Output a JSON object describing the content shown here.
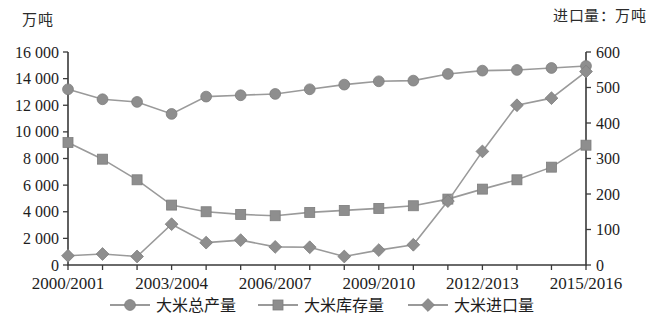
{
  "titles": {
    "left_axis_unit": "万吨",
    "right_axis_unit": "进口量：万吨"
  },
  "chart_data": {
    "type": "line",
    "title": "",
    "subtitle": "",
    "xlabel": "",
    "ylabel": "万吨",
    "y2label": "进口量：万吨",
    "grid": false,
    "legend_position": "bottom",
    "categories": [
      "2000/2001",
      "2001/2002",
      "2002/2003",
      "2003/2004",
      "2004/2005",
      "2005/2006",
      "2006/2007",
      "2007/2008",
      "2008/2009",
      "2009/2010",
      "2010/2011",
      "2011/2012",
      "2012/2013",
      "2013/2014",
      "2014/2015",
      "2015/2016"
    ],
    "x_tick_labels": [
      "2000/2001",
      "2003/2004",
      "2006/2007",
      "2009/2010",
      "2012/2013",
      "2015/2016"
    ],
    "x_tick_indices": [
      0,
      3,
      6,
      9,
      12,
      15
    ],
    "ylim": [
      0,
      16000
    ],
    "y_ticks": [
      0,
      2000,
      4000,
      6000,
      8000,
      10000,
      12000,
      14000,
      16000
    ],
    "y_tick_labels": [
      "0",
      "2 000",
      "4 000",
      "6 000",
      "8 000",
      "10 000",
      "12 000",
      "14 000",
      "16 000"
    ],
    "y2lim": [
      0,
      600
    ],
    "y2_ticks": [
      0,
      100,
      200,
      300,
      400,
      500,
      600
    ],
    "y2_tick_labels": [
      "0",
      "100",
      "200",
      "300",
      "400",
      "500",
      "600"
    ],
    "series": [
      {
        "name": "大米总产量",
        "axis": "left",
        "marker": "circle",
        "color": "#8e8e8e",
        "values": [
          13200,
          12450,
          12250,
          11350,
          12650,
          12750,
          12850,
          13200,
          13550,
          13800,
          13850,
          14350,
          14600,
          14650,
          14800,
          14950
        ]
      },
      {
        "name": "大米库存量",
        "axis": "left",
        "marker": "square",
        "color": "#9b9b9b",
        "values": [
          9200,
          7950,
          6400,
          4500,
          4000,
          3800,
          3700,
          3950,
          4100,
          4250,
          4450,
          4950,
          5700,
          6400,
          7350,
          9000
        ]
      },
      {
        "name": "大米进口量",
        "axis": "right",
        "marker": "diamond",
        "color": "#8e8e8e",
        "values": [
          26,
          31,
          24,
          115,
          63,
          70,
          51,
          50,
          24,
          42,
          57,
          180,
          320,
          450,
          470,
          545
        ]
      }
    ],
    "legend": [
      {
        "label": "大米总产量",
        "marker": "circle"
      },
      {
        "label": "大米库存量",
        "marker": "square"
      },
      {
        "label": "大米进口量",
        "marker": "diamond"
      }
    ]
  }
}
